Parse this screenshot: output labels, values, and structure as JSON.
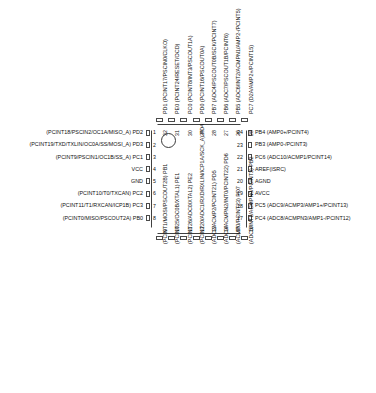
{
  "diagram": {
    "package": "32-pin QFN/MLF",
    "chip_label": "",
    "pin1_marker": "pin1-dot"
  },
  "pins": {
    "left": [
      {
        "num": "1",
        "label": "(PCINT18/PSCIN2/OC1A/MISO_A) PD2"
      },
      {
        "num": "2",
        "label": "(PCINT19/TXD/TXLIN/OC0A/SS/MOSI_A) PD3"
      },
      {
        "num": "3",
        "label": "(PCINT9/PSCIN1/OC1B/SS_A) PC1"
      },
      {
        "num": "4",
        "label": "VCC"
      },
      {
        "num": "5",
        "label": "GND"
      },
      {
        "num": "6",
        "label": "(PCINT10/T0/TXCAN) PC2"
      },
      {
        "num": "7",
        "label": "(PCINT11/T1/RXCAN/ICP1B) PC3"
      },
      {
        "num": "8",
        "label": "(PCINT0/MISO/PSCOUT2A) PB0"
      }
    ],
    "bottom": [
      {
        "num": "9",
        "label": "(PCINT1/MOSI/PSCOUT2B) PB1"
      },
      {
        "num": "10",
        "label": "(PCINT25/OC0B/XTAL1) PE1"
      },
      {
        "num": "11",
        "label": "(PCINT26/ADC0/XTAL2) PE2"
      },
      {
        "num": "12",
        "label": "(PCINT20/ADC1/RXD/RXLIN/ICP1A/SCK_A) PD4"
      },
      {
        "num": "13",
        "label": "(ADC2/ACMP2/PCINT21) PD5"
      },
      {
        "num": "14",
        "label": "(ADC3/ACMPN2/INT0/PCINT22) PD6"
      },
      {
        "num": "15",
        "label": "(ACMP0/PCINT23) PD7"
      },
      {
        "num": "16",
        "label": "(ADC5/INT1/ACMPN0/PCINT3) PB2"
      }
    ],
    "right": [
      {
        "num": "24",
        "label": "PB4 (AMP0+/PCINT4)"
      },
      {
        "num": "23",
        "label": "PB3 (AMP0-/PCINT3)"
      },
      {
        "num": "22",
        "label": "PC6 (ADC10/ACMP1/PCINT14)"
      },
      {
        "num": "21",
        "label": "AREF(ISRC)"
      },
      {
        "num": "20",
        "label": "AGND"
      },
      {
        "num": "19",
        "label": "AVCC"
      },
      {
        "num": "18",
        "label": "PC5 (ADC9/ACMP3/AMP1+/PCINT13)"
      },
      {
        "num": "17",
        "label": "PC4 (ADC8/ACMPN3/AMP1-/PCINT12)"
      }
    ],
    "top": [
      {
        "num": "32",
        "label": "PD1 (PCINT17/PSCIN0/CLKO)"
      },
      {
        "num": "31",
        "label": "PE0 (PCINT24/RESET/OCD)"
      },
      {
        "num": "30",
        "label": "PC0 (PCINT8/INT3/PSCOUT1A)"
      },
      {
        "num": "29",
        "label": "PD0 (PCINT16/PSCOUT0A)"
      },
      {
        "num": "28",
        "label": "PB7 (ADC4/PSCOUT0B/SCK/PCINT7)"
      },
      {
        "num": "27",
        "label": "PB6 (ADC7/PSCOUT1B/PCINT6)"
      },
      {
        "num": "26",
        "label": "PB5 (ADC6/INT2/ACMPN1/AMP2-/PCINT5)"
      },
      {
        "num": "25",
        "label": "PC7 (D2A/AMP2+/PCINT15)"
      }
    ]
  }
}
